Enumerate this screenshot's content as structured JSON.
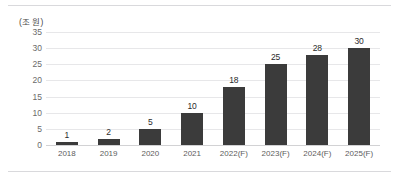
{
  "chart_data": {
    "type": "bar",
    "title": "",
    "subtitle": "",
    "unit_label": "(조 원)",
    "xlabel": "",
    "ylabel": "",
    "categories": [
      "2018",
      "2019",
      "2020",
      "2021",
      "2022(F)",
      "2023(F)",
      "2024(F)",
      "2025(F)"
    ],
    "values": [
      1,
      2,
      5,
      10,
      18,
      25,
      28,
      30
    ],
    "value_labels": [
      "1",
      "2",
      "5",
      "10",
      "18",
      "25",
      "28",
      "30"
    ],
    "ylim": [
      0,
      35
    ],
    "ytick_values": [
      35,
      30,
      25,
      20,
      15,
      10,
      5,
      0
    ],
    "ytick_labels": [
      "35",
      "30",
      "25",
      "20",
      "15",
      "10",
      "5",
      "0"
    ],
    "grid": true,
    "legend": false,
    "legend_position": "none",
    "series": [
      {
        "name": "",
        "values": [
          1,
          2,
          5,
          10,
          18,
          25,
          28,
          30
        ]
      }
    ]
  },
  "style": {
    "bar_color": "#3b3b3b",
    "grid_color": "#e7e7e9",
    "axis_color": "#d2d2d4",
    "rule_color": "#d9d9dc",
    "tick_text_color": "#5d5d5d",
    "value_text_color": "#2b2b2b",
    "background": "#ffffff"
  }
}
